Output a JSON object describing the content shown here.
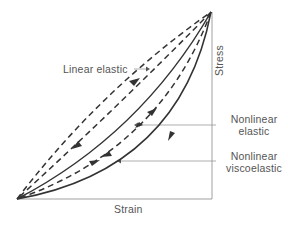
{
  "figure": {
    "type": "stress-strain hysteresis diagram",
    "axes": {
      "x_label": "Strain",
      "y_label": "Stress"
    },
    "curves": [
      {
        "name": "Linear elastic",
        "style": "dashed",
        "loading": "straight line, arrows up and down"
      },
      {
        "name": "Nonlinear elastic",
        "style": "solid loading / dashed unloading",
        "loading": "curved"
      },
      {
        "name": "Nonlinear viscoelastic",
        "style": "solid",
        "loading": "hysteresis loop"
      }
    ],
    "labels": {
      "linear_elastic": "Linear elastic",
      "nonlinear_elastic_line1": "Nonlinear",
      "nonlinear_elastic_line2": "elastic",
      "nonlinear_viscoelastic_line1": "Nonlinear",
      "nonlinear_viscoelastic_line2": "viscoelastic"
    },
    "colors": {
      "curve": "#333333",
      "axis": "#999999",
      "text": "#555555"
    }
  }
}
